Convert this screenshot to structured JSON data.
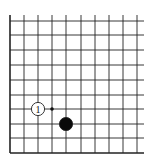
{
  "diagram": {
    "type": "go-board-corner",
    "corner": "bottom-left",
    "columns": 10,
    "rows": 10,
    "line_color": "#222222",
    "background": "#ffffff",
    "x_lines": [
      10,
      24,
      38,
      52,
      66,
      81,
      95,
      109,
      123,
      137
    ],
    "y_lines": [
      21,
      35,
      50,
      65,
      80,
      95,
      109,
      124,
      138,
      153
    ],
    "stones": [
      {
        "color": "white",
        "col": 2,
        "row": 6,
        "label": "1"
      },
      {
        "color": "black",
        "col": 4,
        "row": 7,
        "label": ""
      }
    ],
    "markers": [
      {
        "type": "dot",
        "col": 3,
        "row": 6,
        "color": "#111111"
      }
    ]
  }
}
